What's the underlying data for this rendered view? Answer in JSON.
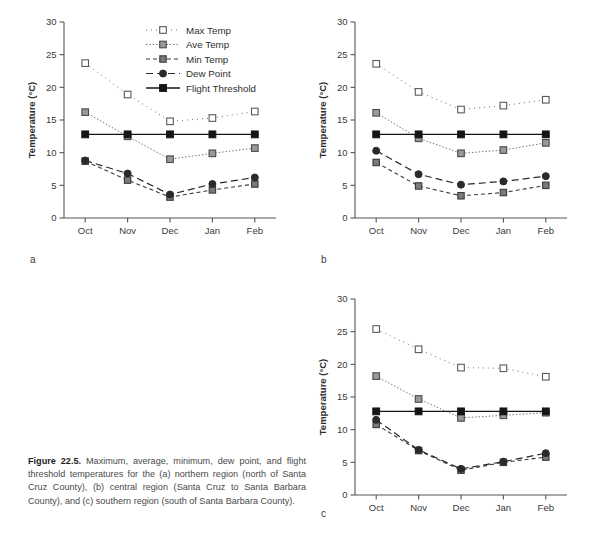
{
  "figure": {
    "caption_label": "Figure 22.5.",
    "caption_text": " Maximum, average, minimum, dew point, and flight threshold temperatures for the (a) northern region (north of Santa Cruz County), (b) central region (Santa Cruz to Santa Barbara County), and (c) southern region (south of Santa Barbara County)."
  },
  "panels": {
    "a": {
      "letter": "a",
      "region": "northern region"
    },
    "b": {
      "letter": "b",
      "region": "central region"
    },
    "c": {
      "letter": "c",
      "region": "southern region"
    }
  },
  "axis": {
    "ylabel": "Temperature (°C)",
    "yticks": [
      "0",
      "5",
      "10",
      "15",
      "20",
      "25",
      "30"
    ],
    "xticks": [
      "Oct",
      "Nov",
      "Dec",
      "Jan",
      "Feb"
    ]
  },
  "legend": {
    "items": [
      {
        "label": "Max Temp",
        "style": "dotted-sparse",
        "marker": "open-square",
        "color": "#4d4d4d"
      },
      {
        "label": "Ave Temp",
        "style": "dotted",
        "marker": "half-square",
        "color": "#4d4d4d"
      },
      {
        "label": "Min Temp",
        "style": "dashed",
        "marker": "filled-square-gray",
        "color": "#333333"
      },
      {
        "label": "Dew Point",
        "style": "long-dash",
        "marker": "filled-circle",
        "color": "#262626"
      },
      {
        "label": "Flight Threshold",
        "style": "solid",
        "marker": "filled-square",
        "color": "#111111"
      }
    ]
  },
  "chart_data": [
    {
      "type": "line",
      "panel": "a",
      "title": "(a) northern region (north of Santa Cruz County)",
      "xlabel": "",
      "ylabel": "Temperature (°C)",
      "categories": [
        "Oct",
        "Nov",
        "Dec",
        "Jan",
        "Feb"
      ],
      "ylim": [
        0,
        30
      ],
      "xgrid": false,
      "ygrid": false,
      "legend_position": "top-right",
      "series": [
        {
          "name": "Max Temp",
          "values": [
            23.7,
            18.9,
            14.8,
            15.3,
            16.3
          ]
        },
        {
          "name": "Ave Temp",
          "values": [
            16.2,
            12.5,
            9.0,
            9.9,
            10.7
          ]
        },
        {
          "name": "Min Temp",
          "values": [
            8.7,
            5.8,
            3.2,
            4.3,
            5.2
          ]
        },
        {
          "name": "Dew Point",
          "values": [
            8.8,
            6.8,
            3.6,
            5.2,
            6.2
          ]
        },
        {
          "name": "Flight Threshold",
          "values": [
            12.8,
            12.8,
            12.8,
            12.8,
            12.8
          ]
        }
      ]
    },
    {
      "type": "line",
      "panel": "b",
      "title": "(b) central region (Santa Cruz to Santa Barbara County)",
      "xlabel": "",
      "ylabel": "Temperature (°C)",
      "categories": [
        "Oct",
        "Nov",
        "Dec",
        "Jan",
        "Feb"
      ],
      "ylim": [
        0,
        30
      ],
      "xgrid": false,
      "ygrid": false,
      "legend_position": "none",
      "series": [
        {
          "name": "Max Temp",
          "values": [
            23.6,
            19.3,
            16.6,
            17.2,
            18.1
          ]
        },
        {
          "name": "Ave Temp",
          "values": [
            16.1,
            12.2,
            9.9,
            10.4,
            11.5
          ]
        },
        {
          "name": "Min Temp",
          "values": [
            8.5,
            4.9,
            3.4,
            3.9,
            5.0
          ]
        },
        {
          "name": "Dew Point",
          "values": [
            10.3,
            6.7,
            5.1,
            5.6,
            6.4
          ]
        },
        {
          "name": "Flight Threshold",
          "values": [
            12.8,
            12.8,
            12.8,
            12.8,
            12.8
          ]
        }
      ]
    },
    {
      "type": "line",
      "panel": "c",
      "title": "(c) southern region (south of Santa Barbara County)",
      "xlabel": "",
      "ylabel": "Temperature (°C)",
      "categories": [
        "Oct",
        "Nov",
        "Dec",
        "Jan",
        "Feb"
      ],
      "ylim": [
        0,
        30
      ],
      "xgrid": false,
      "ygrid": false,
      "legend_position": "none",
      "series": [
        {
          "name": "Max Temp",
          "values": [
            25.4,
            22.3,
            19.5,
            19.4,
            18.1
          ]
        },
        {
          "name": "Ave Temp",
          "values": [
            18.2,
            14.7,
            11.8,
            12.2,
            12.6
          ]
        },
        {
          "name": "Min Temp",
          "values": [
            10.8,
            6.8,
            3.8,
            5.0,
            5.8
          ]
        },
        {
          "name": "Dew Point",
          "values": [
            11.5,
            6.9,
            4.0,
            5.1,
            6.4
          ]
        },
        {
          "name": "Flight Threshold",
          "values": [
            12.8,
            12.8,
            12.8,
            12.8,
            12.8
          ]
        }
      ]
    }
  ]
}
